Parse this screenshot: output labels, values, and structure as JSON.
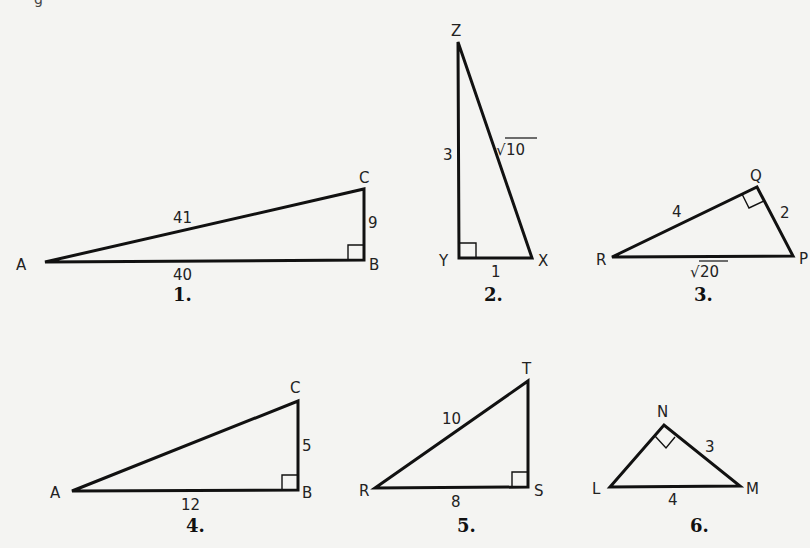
{
  "top_fragment": "g",
  "figures": [
    {
      "number": "1.",
      "vertices": {
        "A": "A",
        "B": "B",
        "C": "C"
      },
      "sides": {
        "AC": "41",
        "BC": "9",
        "AB": "40"
      },
      "right_angle_at": "B"
    },
    {
      "number": "2.",
      "vertices": {
        "Z": "Z",
        "Y": "Y",
        "X": "X"
      },
      "sides": {
        "ZY": "3",
        "ZX_radical": "√",
        "ZX_value": "10",
        "YX": "1"
      },
      "right_angle_at": "Y"
    },
    {
      "number": "3.",
      "vertices": {
        "Q": "Q",
        "R": "R",
        "P": "P"
      },
      "sides": {
        "RQ": "4",
        "QP": "2",
        "RP_radical": "√",
        "RP_value": "20"
      },
      "right_angle_at": "Q"
    },
    {
      "number": "4.",
      "vertices": {
        "A": "A",
        "B": "B",
        "C": "C"
      },
      "sides": {
        "BC": "5",
        "AB": "12"
      },
      "right_angle_at": "B"
    },
    {
      "number": "5.",
      "vertices": {
        "T": "T",
        "R": "R",
        "S": "S"
      },
      "sides": {
        "RT": "10",
        "RS": "8"
      },
      "right_angle_at": "S"
    },
    {
      "number": "6.",
      "vertices": {
        "N": "N",
        "L": "L",
        "M": "M"
      },
      "sides": {
        "NM": "3",
        "LM": "4"
      },
      "right_angle_at": "N"
    }
  ]
}
